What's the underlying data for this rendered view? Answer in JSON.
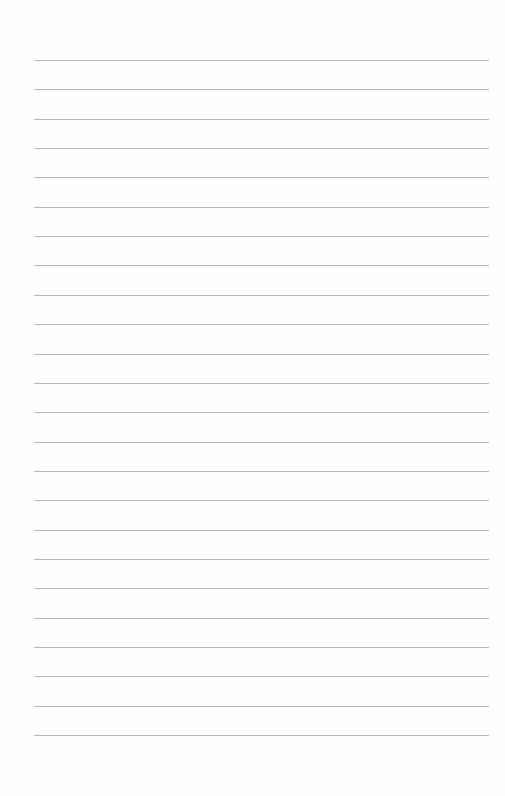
{
  "page": {
    "type": "blank-lined-paper",
    "background": "#fefefe",
    "rule_color": "#a9a9a9",
    "rule_count": 24,
    "rule_start_y": 60,
    "rule_spacing": 29.35,
    "rule_left": 34,
    "rule_right": 489
  }
}
